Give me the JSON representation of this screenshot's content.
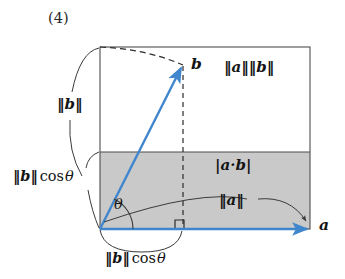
{
  "figure": {
    "item_number": "(4)",
    "caption_context": "Geometric interpretation of the dot product: |a·b| = ‖a‖ ‖b‖ cos θ",
    "colors": {
      "vector_blue": "#4a90d4",
      "shaded_gray": "#c9c9c9",
      "outline_gray": "#555555",
      "text_black": "#141414",
      "background": "#ffffff"
    },
    "labels": {
      "norm_a_norm_b": "‖a‖‖b‖",
      "vector_b": "b",
      "vector_a": "a",
      "abs_a_dot_b": "|a·b|",
      "norm_a": "‖a‖",
      "norm_b": "‖b‖",
      "norm_b_cos_theta_left": "‖b‖cos θ",
      "norm_b_cos_theta_bottom": "‖b‖cos θ",
      "theta": "θ"
    },
    "parts": {
      "norm_b_cos_left_bars": "‖b‖",
      "norm_b_cos_left_cos": "cos",
      "norm_b_cos_left_theta": "θ",
      "norm_b_cos_bottom_bars": "‖b‖",
      "norm_b_cos_bottom_cos": "cos",
      "norm_b_cos_bottom_theta": "θ"
    },
    "geometry": {
      "rect_left": 100,
      "rect_top": 47,
      "rect_right": 310,
      "rect_bottom": 229,
      "shaded_top": 152,
      "origin_x": 100,
      "origin_y": 229,
      "vector_b_tip_x": 183,
      "vector_b_tip_y": 65,
      "vector_a_tip_x": 310,
      "vector_a_tip_y": 229,
      "projection_x": 183,
      "angle_theta_degrees": 64
    }
  }
}
